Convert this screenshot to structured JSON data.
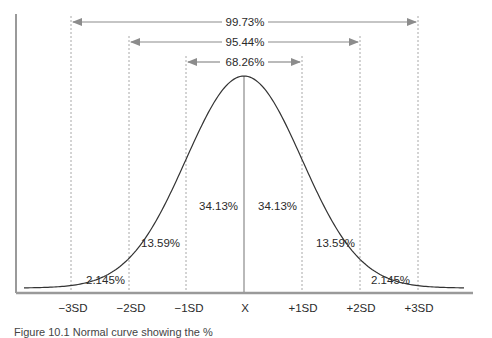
{
  "diagram": {
    "ranges": [
      {
        "label": "99.73%",
        "from": "-3SD",
        "to": "+3SD"
      },
      {
        "label": "95.44%",
        "from": "-2SD",
        "to": "+2SD"
      },
      {
        "label": "68.26%",
        "from": "-1SD",
        "to": "+1SD"
      }
    ],
    "segments": [
      {
        "label": "2.145%",
        "region": "-3SD to -2SD"
      },
      {
        "label": "13.59%",
        "region": "-2SD to -1SD"
      },
      {
        "label": "34.13%",
        "region": "-1SD to X"
      },
      {
        "label": "34.13%",
        "region": "X to +1SD"
      },
      {
        "label": "13.59%",
        "region": "+1SD to +2SD"
      },
      {
        "label": "2.145%",
        "region": "+2SD to +3SD"
      }
    ],
    "x_ticks": [
      "−3SD",
      "−2SD",
      "−1SD",
      "X",
      "+1SD",
      "+2SD",
      "+3SD"
    ],
    "caption": "Figure 10.1   Normal curve showing the %"
  },
  "colors": {
    "curve": "#333333",
    "axis": "#9a9a9a",
    "guides": "#a8a8a8",
    "arrows": "#8c8c8c",
    "text": "#2a2a2a"
  }
}
